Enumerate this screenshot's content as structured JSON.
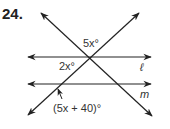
{
  "problem": {
    "number": "24.",
    "labels": {
      "top_angle": "5x°",
      "left_angle": "2x°",
      "line_l": "ℓ",
      "line_m": "m",
      "bottom_angle": "(5x + 40)°"
    }
  },
  "colors": {
    "line": "#222222",
    "text": "#333333",
    "background": "#ffffff"
  }
}
